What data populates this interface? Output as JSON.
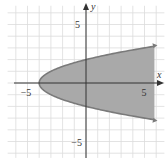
{
  "chart_data": {
    "type": "area",
    "title": "",
    "xlabel": "x",
    "ylabel": "y",
    "xlim": [
      -6,
      6
    ],
    "ylim": [
      -6,
      6
    ],
    "grid": true,
    "x_ticks_labeled": [
      {
        "value": -5,
        "label": "−5"
      },
      {
        "value": 5,
        "label": "5"
      }
    ],
    "y_ticks_labeled": [
      {
        "value": 5,
        "label": "5"
      },
      {
        "value": -5,
        "label": "−5"
      }
    ],
    "series": [
      {
        "name": "boundary",
        "equation": "x = y^2 - 4",
        "region": "x >= y^2 - 4",
        "vertex": [
          -4,
          0
        ],
        "points": [
          [
            6,
            3.16
          ],
          [
            5,
            3
          ],
          [
            4,
            2.83
          ],
          [
            2,
            2.45
          ],
          [
            0,
            2
          ],
          [
            -2,
            1.41
          ],
          [
            -3,
            1
          ],
          [
            -4,
            0
          ],
          [
            -3,
            -1
          ],
          [
            -2,
            -1.41
          ],
          [
            0,
            -2
          ],
          [
            2,
            -2.45
          ],
          [
            4,
            -2.83
          ],
          [
            5,
            -3
          ],
          [
            6,
            -3.16
          ]
        ],
        "shaded": true,
        "arrows_at_ends": true
      }
    ],
    "colors": {
      "fill": "#a9a9a9",
      "boundary": "#7a7a7a",
      "grid": "#dcdcdc",
      "axis": "#333333"
    }
  },
  "labels": {
    "x_axis": "x",
    "y_axis": "y",
    "x_neg5": "−5",
    "x_pos5": "5",
    "y_pos5": "5",
    "y_neg5": "−5"
  }
}
